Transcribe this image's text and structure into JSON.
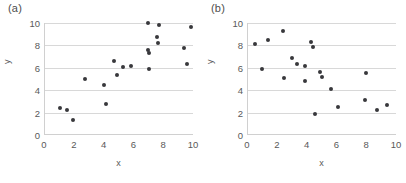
{
  "figure": {
    "background": "#ffffff",
    "marker_color": "#38383c",
    "grid_color": "#d8d8d8",
    "axis_color": "#d0d0d0",
    "text_color": "#595959"
  },
  "chart_data": [
    {
      "type": "scatter",
      "title": "(a)",
      "xlabel": "x",
      "ylabel": "y",
      "xlim": [
        0,
        10
      ],
      "ylim": [
        0,
        10
      ],
      "xticks": [
        0,
        2,
        4,
        6,
        8,
        10
      ],
      "yticks": [
        0,
        2,
        4,
        6,
        8,
        10
      ],
      "xtick_labels": [
        "0",
        "2",
        "4",
        "6",
        "8",
        "10"
      ],
      "ytick_labels": [
        "0",
        "2",
        "4",
        "6",
        "8",
        "10"
      ],
      "grid": "horizontal",
      "legend": "none",
      "points": [
        {
          "x": 1.0,
          "y": 2.4
        },
        {
          "x": 1.45,
          "y": 2.2
        },
        {
          "x": 1.9,
          "y": 1.35
        },
        {
          "x": 2.7,
          "y": 5.0
        },
        {
          "x": 3.95,
          "y": 4.5
        },
        {
          "x": 4.1,
          "y": 2.75
        },
        {
          "x": 4.65,
          "y": 6.6
        },
        {
          "x": 4.8,
          "y": 5.35
        },
        {
          "x": 5.25,
          "y": 6.05
        },
        {
          "x": 5.8,
          "y": 6.2
        },
        {
          "x": 6.9,
          "y": 10.0
        },
        {
          "x": 6.9,
          "y": 7.6
        },
        {
          "x": 6.95,
          "y": 7.35
        },
        {
          "x": 6.95,
          "y": 5.85
        },
        {
          "x": 7.5,
          "y": 8.75
        },
        {
          "x": 7.6,
          "y": 8.25
        },
        {
          "x": 7.65,
          "y": 9.8
        },
        {
          "x": 9.35,
          "y": 7.8
        },
        {
          "x": 9.5,
          "y": 6.3
        },
        {
          "x": 9.8,
          "y": 9.6
        }
      ]
    },
    {
      "type": "scatter",
      "title": "(b)",
      "xlabel": "x",
      "ylabel": "y",
      "xlim": [
        0,
        10
      ],
      "ylim": [
        0,
        10
      ],
      "xticks": [
        0,
        2,
        4,
        6,
        8,
        10
      ],
      "yticks": [
        0,
        2,
        4,
        6,
        8,
        10
      ],
      "xtick_labels": [
        "0",
        "2",
        "4",
        "6",
        "8",
        "10"
      ],
      "ytick_labels": [
        "0",
        "2",
        "4",
        "6",
        "8",
        "10"
      ],
      "grid": "horizontal",
      "legend": "none",
      "points": [
        {
          "x": 0.45,
          "y": 8.1
        },
        {
          "x": 0.95,
          "y": 5.85
        },
        {
          "x": 1.35,
          "y": 8.5
        },
        {
          "x": 2.35,
          "y": 9.3
        },
        {
          "x": 2.4,
          "y": 5.1
        },
        {
          "x": 2.95,
          "y": 6.85
        },
        {
          "x": 3.3,
          "y": 6.3
        },
        {
          "x": 3.8,
          "y": 6.2
        },
        {
          "x": 3.85,
          "y": 4.85
        },
        {
          "x": 4.25,
          "y": 8.3
        },
        {
          "x": 4.35,
          "y": 7.85
        },
        {
          "x": 4.5,
          "y": 1.9
        },
        {
          "x": 4.85,
          "y": 5.65
        },
        {
          "x": 4.95,
          "y": 5.15
        },
        {
          "x": 5.55,
          "y": 4.1
        },
        {
          "x": 6.05,
          "y": 2.5
        },
        {
          "x": 7.85,
          "y": 3.1
        },
        {
          "x": 7.95,
          "y": 5.55
        },
        {
          "x": 8.65,
          "y": 2.2
        },
        {
          "x": 9.3,
          "y": 2.7
        }
      ]
    }
  ]
}
